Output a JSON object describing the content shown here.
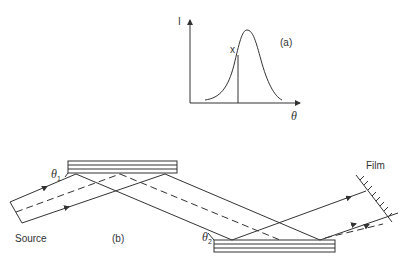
{
  "panel_a": {
    "label": "(a)",
    "y_axis_label": "I",
    "x_axis_label": "θ",
    "marker_label": "x"
  },
  "panel_b": {
    "label": "(b)",
    "source_label": "Source",
    "film_label": "Film",
    "theta1_label": "θ",
    "theta1_sub": "1",
    "theta2_label": "θ",
    "theta2_sub": "2"
  },
  "colors": {
    "line": "#333333",
    "background": "#ffffff"
  }
}
